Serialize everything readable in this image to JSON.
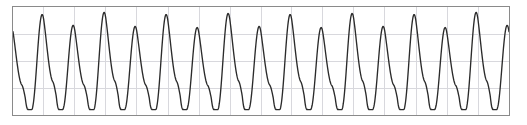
{
  "figure": {
    "name": "waveform-plot",
    "width": 527,
    "height": 125,
    "background_color": "#ffffff"
  },
  "plot": {
    "border_color": "#8a8a8a",
    "plot_background": "#ffffff",
    "left": 12,
    "top": 6,
    "width": 498,
    "height": 110
  },
  "chart_data": {
    "type": "line",
    "title": "",
    "subtitle": "",
    "xlabel": "",
    "ylabel": "",
    "legend": [],
    "annotations": [],
    "grid": {
      "visible": true,
      "color": "#d8d8dd",
      "x_gridlines": [
        0,
        31,
        62,
        93,
        124,
        156,
        187,
        218,
        249,
        280,
        311,
        342,
        373,
        405,
        436,
        467,
        498
      ],
      "y_gridlines": [
        0,
        27.5,
        55,
        82.5,
        110
      ]
    },
    "axes": {
      "xlim": [
        0,
        16.2
      ],
      "ylim": [
        0,
        1
      ],
      "xticks": [],
      "yticks": [],
      "xticklabels": [],
      "yticklabels": []
    },
    "series": [
      {
        "name": "periodic-signal",
        "color": "#2b2b2b",
        "linewidth": 1.35,
        "description": "Quasi-periodic oscillation with rounded peaks of alternating amplitude and sharp narrow troughs",
        "cycle_count": 16,
        "peak_amplitudes_alternating": [
          0.83,
          0.93,
          0.83,
          0.95,
          0.82,
          0.93,
          0.81,
          0.94,
          0.82,
          0.93,
          0.81,
          0.94,
          0.82,
          0.93,
          0.81,
          0.95
        ],
        "trough_level": 0.05,
        "x": [
          0.0,
          0.08,
          0.16,
          0.24,
          0.32,
          0.4,
          0.48,
          0.56,
          0.64,
          0.72,
          0.8,
          0.88,
          0.96,
          1.04,
          1.12,
          1.2,
          1.28,
          1.36,
          1.44,
          1.52,
          1.6,
          1.68,
          1.76,
          1.84,
          1.92,
          2.0
        ],
        "values": [
          0.83,
          0.78,
          0.7,
          0.6,
          0.48,
          0.34,
          0.2,
          0.1,
          0.05,
          0.08,
          0.2,
          0.4,
          0.62,
          0.8,
          0.9,
          0.93,
          0.9,
          0.82,
          0.7,
          0.56,
          0.4,
          0.25,
          0.13,
          0.06,
          0.05,
          0.12
        ]
      }
    ]
  }
}
